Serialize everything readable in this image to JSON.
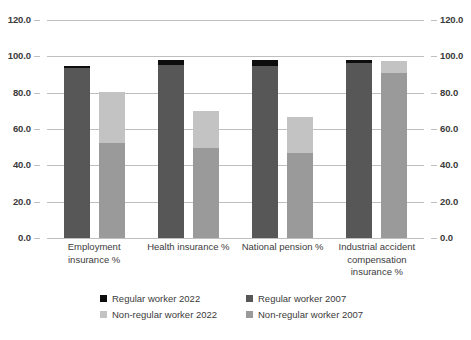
{
  "chart_data": {
    "type": "bar",
    "title": "",
    "subtitle": "",
    "xlabel": "",
    "ylabel": "",
    "ylim": [
      0,
      120
    ],
    "yticks": [
      "0.0",
      "20.0",
      "40.0",
      "60.0",
      "80.0",
      "100.0",
      "120.0"
    ],
    "ytick_values": [
      0,
      20,
      40,
      60,
      80,
      100,
      120
    ],
    "grid": true,
    "dual_axis": true,
    "legend_position": "bottom",
    "stacked": false,
    "categories": [
      "Employment insurance %",
      "Health insurance %",
      "National pension %",
      "Industrial accident compensation insurance %"
    ],
    "category_lines": [
      [
        "Employment",
        "insurance %"
      ],
      [
        "Health insurance %"
      ],
      [
        "National pension %"
      ],
      [
        "Industrial accident",
        "compensation",
        "insurance %"
      ]
    ],
    "series": [
      {
        "name": "Regular worker 2022",
        "color": "#0d0d0d",
        "values": [
          94.6,
          98.0,
          97.8,
          97.9
        ]
      },
      {
        "name": "Regular worker 2007",
        "color": "#575757",
        "values": [
          93.4,
          95.2,
          94.5,
          96.1
        ]
      },
      {
        "name": "Non-regular worker 2022",
        "color": "#c3c3c3",
        "values": [
          80.4,
          69.8,
          66.7,
          97.6
        ]
      },
      {
        "name": "Non-regular worker 2007",
        "color": "#9a9a9a",
        "values": [
          52.2,
          49.4,
          46.8,
          90.6
        ]
      }
    ],
    "legend": [
      {
        "label": "Regular worker 2022",
        "color": "#0d0d0d"
      },
      {
        "label": "Regular worker 2007",
        "color": "#575757"
      },
      {
        "label": "Non-regular worker 2022",
        "color": "#c3c3c3"
      },
      {
        "label": "Non-regular worker 2007",
        "color": "#9a9a9a"
      }
    ],
    "axis_left_labels": [
      "120.0",
      "100.0",
      "80.0",
      "60.0",
      "40.0",
      "20.0",
      "0.0"
    ],
    "axis_right_labels": [
      "120.0",
      "100.0",
      "80.0",
      "60.0",
      "40.0",
      "20.0",
      "0.0"
    ],
    "colors": {
      "gridline": "#bfbfbf",
      "text": "#3b3b3b",
      "background": "#ffffff"
    }
  }
}
